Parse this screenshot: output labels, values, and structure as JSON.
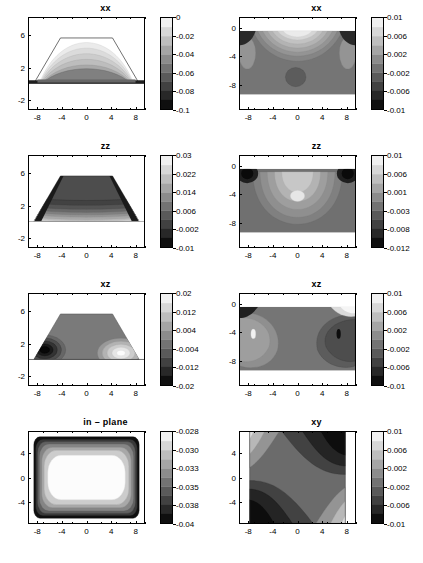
{
  "figure": {
    "layout": "4 rows x 2 columns of filled contour plots, each with its own vertical grayscale colorbar",
    "rows": 4,
    "cols": 2
  },
  "chart_data": [
    {
      "type": "heatmap",
      "id": "panel-xx-left",
      "title": "xx",
      "position": "row1-col1",
      "xlabel": "",
      "ylabel": "",
      "xlim": [
        -9.5,
        9.5
      ],
      "ylim": [
        -3.2,
        8.2
      ],
      "xticks": [
        -8,
        -4,
        0,
        4,
        8
      ],
      "xticklabels": [
        "-8",
        "-4",
        "0",
        "4",
        "8"
      ],
      "yticks": [
        6,
        2,
        -2
      ],
      "yticklabels": [
        "6",
        "2",
        "-2"
      ],
      "grid": false,
      "colorbar": {
        "ticks": [
          0,
          -0.02,
          -0.04,
          -0.06,
          -0.08,
          -0.1
        ],
        "ticklabels": [
          "0",
          "-0.02",
          "-0.04",
          "-0.06",
          "-0.08",
          "-0.1"
        ],
        "vmin": -0.1,
        "vmax": 0,
        "cmap": "gray"
      },
      "description": "Trapezoidal island cross-section; nested contours inside the trapezoid fading from near 0 at top to -0.1 dark band at the base interface"
    },
    {
      "type": "heatmap",
      "id": "panel-xx-right",
      "title": "xx",
      "position": "row1-col2",
      "xlabel": "",
      "ylabel": "",
      "xlim": [
        -9.5,
        9.5
      ],
      "ylim": [
        -11.5,
        1.5
      ],
      "xticks": [
        -8,
        -4,
        0,
        4,
        8
      ],
      "xticklabels": [
        "-8",
        "-4",
        "0",
        "4",
        "8"
      ],
      "yticks": [
        0,
        -4,
        -8
      ],
      "yticklabels": [
        "0",
        "-4",
        "-8"
      ],
      "grid": false,
      "colorbar": {
        "ticks": [
          0.01,
          0.006,
          0.002,
          -0.002,
          -0.006,
          -0.01
        ],
        "ticklabels": [
          "0.01",
          "0.006",
          "0.002",
          "-0.002",
          "-0.006",
          "-0.01"
        ],
        "vmin": -0.01,
        "vmax": 0.01,
        "cmap": "gray"
      },
      "description": "Substrate region; arched light contours under the surface, dark corners at the left and right surface edges, small dark lobe near x=0, y=-7"
    },
    {
      "type": "heatmap",
      "id": "panel-zz-left",
      "title": "zz",
      "position": "row2-col1",
      "xlabel": "",
      "ylabel": "",
      "xlim": [
        -9.5,
        9.5
      ],
      "ylim": [
        -3.2,
        8.2
      ],
      "xticks": [
        -8,
        -4,
        0,
        4,
        8
      ],
      "xticklabels": [
        "-8",
        "-4",
        "0",
        "4",
        "8"
      ],
      "yticks": [
        6,
        2,
        -2
      ],
      "yticklabels": [
        "6",
        "2",
        "-2"
      ],
      "grid": false,
      "colorbar": {
        "ticks": [
          0.03,
          0.022,
          0.014,
          0.006,
          -0.002,
          -0.01
        ],
        "ticklabels": [
          "0.03",
          "0.022",
          "0.014",
          "0.006",
          "-0.002",
          "-0.01"
        ],
        "vmin": -0.01,
        "vmax": 0.03,
        "cmap": "gray"
      },
      "description": "Trapezoidal island filled mostly dark with stacked horizontal contour bands brightening toward the base"
    },
    {
      "type": "heatmap",
      "id": "panel-zz-right",
      "title": "zz",
      "position": "row2-col2",
      "xlabel": "",
      "ylabel": "",
      "xlim": [
        -9.5,
        9.5
      ],
      "ylim": [
        -11.5,
        1.5
      ],
      "xticks": [
        -8,
        -4,
        0,
        4,
        8
      ],
      "xticklabels": [
        "-8",
        "-4",
        "0",
        "4",
        "8"
      ],
      "yticks": [
        0,
        -4,
        -8
      ],
      "yticklabels": [
        "0",
        "-4",
        "-8"
      ],
      "grid": false,
      "colorbar": {
        "ticks": [
          0.01,
          0.006,
          0.001,
          -0.003,
          -0.008,
          -0.012
        ],
        "ticklabels": [
          "0.01",
          "0.006",
          "0.001",
          "-0.003",
          "-0.008",
          "-0.012"
        ],
        "vmin": -0.012,
        "vmax": 0.01,
        "cmap": "gray"
      },
      "description": "Substrate; large bright closed lobe centered near x=0, y=-4 with a small white core, very dark spots at both upper corners"
    },
    {
      "type": "heatmap",
      "id": "panel-xz-left",
      "title": "xz",
      "position": "row3-col1",
      "xlabel": "",
      "ylabel": "",
      "xlim": [
        -9.5,
        9.5
      ],
      "ylim": [
        -3.2,
        8.2
      ],
      "xticks": [
        -8,
        -4,
        0,
        4,
        8
      ],
      "xticklabels": [
        "-8",
        "-4",
        "0",
        "4",
        "8"
      ],
      "yticks": [
        6,
        2,
        -2
      ],
      "yticklabels": [
        "6",
        "2",
        "-2"
      ],
      "grid": false,
      "colorbar": {
        "ticks": [
          0.02,
          0.012,
          0.004,
          -0.004,
          -0.012,
          -0.02
        ],
        "ticklabels": [
          "0.02",
          "0.012",
          "0.004",
          "-0.004",
          "-0.012",
          "-0.02"
        ],
        "vmin": -0.02,
        "vmax": 0.02,
        "cmap": "gray"
      },
      "description": "Antisymmetric shear: dark (negative) lobe at the lower-left foot of the island and bright (positive) lobe at the lower-right foot"
    },
    {
      "type": "heatmap",
      "id": "panel-xz-right",
      "title": "xz",
      "position": "row3-col2",
      "xlabel": "",
      "ylabel": "",
      "xlim": [
        -9.5,
        9.5
      ],
      "ylim": [
        -11.5,
        1.5
      ],
      "xticks": [
        -8,
        -4,
        0,
        4,
        8
      ],
      "xticklabels": [
        "-8",
        "-4",
        "0",
        "4",
        "8"
      ],
      "yticks": [
        0,
        -4,
        -8
      ],
      "yticklabels": [
        "0",
        "-4",
        "-8"
      ],
      "grid": false,
      "colorbar": {
        "ticks": [
          0.01,
          0.006,
          0.002,
          -0.002,
          -0.006,
          -0.01
        ],
        "ticklabels": [
          "0.01",
          "0.006",
          "0.002",
          "-0.002",
          "-0.006",
          "-0.01"
        ],
        "vmin": -0.01,
        "vmax": 0.01,
        "cmap": "gray"
      },
      "description": "Substrate shear; bright lobe on the left half with a small white core near x=-6,y=-4, darker lobe on the right half with a small black core near x=5,y=-4"
    },
    {
      "type": "heatmap",
      "id": "panel-in-plane",
      "title": "in – plane",
      "position": "row4-col1",
      "xlabel": "",
      "ylabel": "",
      "xlim": [
        -9.5,
        9.5
      ],
      "ylim": [
        -7.5,
        7.5
      ],
      "xticks": [
        -8,
        -4,
        0,
        4,
        8
      ],
      "xticklabels": [
        "-8",
        "-4",
        "0",
        "4",
        "8"
      ],
      "yticks": [
        4,
        0,
        -4
      ],
      "yticklabels": [
        "4",
        "0",
        "-4"
      ],
      "grid": false,
      "colorbar": {
        "ticks": [
          -0.028,
          -0.03,
          -0.033,
          -0.035,
          -0.038,
          -0.04
        ],
        "ticklabels": [
          "-0.028",
          "-0.030",
          "-0.033",
          "-0.035",
          "-0.038",
          "-0.04"
        ],
        "vmin": -0.04,
        "vmax": -0.028,
        "cmap": "gray"
      },
      "description": "Plan-view: large white rounded-square plateau in the centre surrounded by concentric grey rings and a black rounded-square border"
    },
    {
      "type": "heatmap",
      "id": "panel-xy",
      "title": "xy",
      "position": "row4-col2",
      "xlabel": "",
      "ylabel": "",
      "xlim": [
        -9.5,
        9.5
      ],
      "ylim": [
        -7.5,
        7.5
      ],
      "xticks": [
        -8,
        -4,
        0,
        4,
        8
      ],
      "xticklabels": [
        "-8",
        "-4",
        "0",
        "4",
        "8"
      ],
      "yticks": [
        4,
        0,
        -4
      ],
      "yticklabels": [
        "4",
        "0",
        "-4"
      ],
      "grid": false,
      "colorbar": {
        "ticks": [
          0.01,
          0.006,
          0.002,
          -0.002,
          -0.006,
          -0.01
        ],
        "ticklabels": [
          "0.01",
          "0.006",
          "0.002",
          "-0.002",
          "-0.006",
          "-0.01"
        ],
        "vmin": -0.01,
        "vmax": 0.01,
        "cmap": "gray"
      },
      "description": "Plan-view four-fold shear pattern: dark lobes at upper-right and lower-left diagonal corners, light lobes at upper-left and lower-right, white vertical strips outside x=±7.5"
    }
  ]
}
